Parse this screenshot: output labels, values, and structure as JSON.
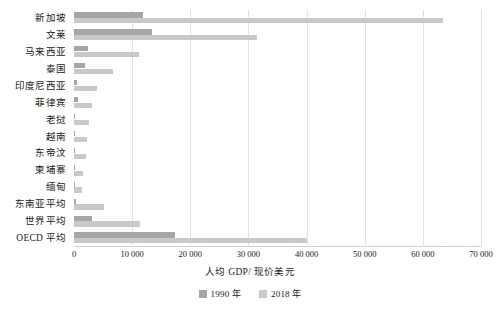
{
  "chart_data": {
    "type": "bar",
    "orientation": "horizontal",
    "title": "",
    "xlabel": "人均 GDP/ 现价美元",
    "ylabel": "",
    "xlim": [
      0,
      70000
    ],
    "xticks": [
      0,
      10000,
      20000,
      30000,
      40000,
      50000,
      60000,
      70000
    ],
    "xticklabels": [
      "0",
      "10 000",
      "20 000",
      "30 000",
      "40 000",
      "50 000",
      "60 000",
      "70 000"
    ],
    "grid": true,
    "legend_position": "bottom",
    "categories": [
      "新加坡",
      "文莱",
      "马来西亚",
      "泰国",
      "印度尼西亚",
      "菲律宾",
      "老挝",
      "越南",
      "东帝汶",
      "柬埔寨",
      "缅甸",
      "东南亚平均",
      "世界平均",
      "OECD 平均"
    ],
    "series": [
      {
        "name": "1990 年",
        "color": "#a6a6a6",
        "values": [
          11800,
          13500,
          2400,
          1900,
          600,
          720,
          200,
          95,
          250,
          180,
          190,
          420,
          3100,
          17400
        ]
      },
      {
        "name": "2018 年",
        "color": "#c9c9c9",
        "values": [
          63500,
          31400,
          11200,
          6700,
          3900,
          3100,
          2500,
          2200,
          2000,
          1500,
          1300,
          5200,
          11300,
          40100
        ]
      }
    ]
  },
  "legend": {
    "items": [
      {
        "label": "1990 年",
        "color": "#a6a6a6"
      },
      {
        "label": "2018 年",
        "color": "#c9c9c9"
      }
    ]
  }
}
